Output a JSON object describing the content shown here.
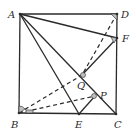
{
  "diagram": {
    "type": "geometry",
    "colors": {
      "line": "#2a2a2a",
      "background": "#ffffff",
      "marker": "#bfbfbf"
    },
    "points": {
      "A": {
        "label": "A",
        "x": 20,
        "y": 14
      },
      "D": {
        "label": "D",
        "x": 117,
        "y": 14
      },
      "B": {
        "label": "B",
        "x": 19,
        "y": 113
      },
      "C": {
        "label": "C",
        "x": 116,
        "y": 114
      },
      "F": {
        "label": "F",
        "x": 117,
        "y": 38
      },
      "E": {
        "label": "E",
        "x": 79,
        "y": 114
      },
      "Q": {
        "label": "Q",
        "x": 82,
        "y": 75
      },
      "P": {
        "label": "P",
        "x": 95,
        "y": 96
      }
    },
    "solid_segments": [
      "AB",
      "AD",
      "DC",
      "BC",
      "AF",
      "AE",
      "AC",
      "FQ",
      "PE"
    ],
    "dashed_segments": [
      "DQ",
      "BQ",
      "BP"
    ],
    "angle_marks": [
      "D",
      "F",
      "B",
      "Q",
      "P"
    ],
    "right_angle_marks": [
      "B"
    ]
  }
}
